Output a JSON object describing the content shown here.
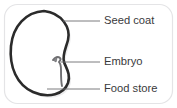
{
  "figure": {
    "name": "seed-structure-diagram",
    "background_color": "#ffffff",
    "frame": {
      "name": "rounded-frame",
      "stroke_color": "#e4e4e6",
      "corner_radius": 13,
      "stroke_width": 1.2
    }
  },
  "seed": {
    "outline_color": "#2b2b2b",
    "outline_width": 2.6,
    "inner_fill": "#ffffff",
    "shadow_color": "#d8d8da",
    "embryo_color": "#6f6f72"
  },
  "leaders": {
    "color": "#6d6d70",
    "width": 0.9
  },
  "labels": [
    {
      "id": "seed-coat",
      "text": "Seed coat",
      "x": 104,
      "y": 21,
      "leader_x1": 63,
      "leader_y1": 21,
      "leader_x2": 100,
      "leader_y2": 21
    },
    {
      "id": "embryo",
      "text": "Embryo",
      "x": 104,
      "y": 62,
      "leader_x1": 61,
      "leader_y1": 62,
      "leader_x2": 100,
      "leader_y2": 62
    },
    {
      "id": "food-store",
      "text": "Food store",
      "x": 104,
      "y": 89,
      "leader_x1": 47,
      "leader_y1": 89,
      "leader_x2": 100,
      "leader_y2": 89
    }
  ]
}
